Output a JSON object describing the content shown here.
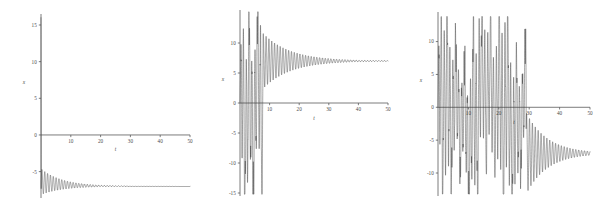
{
  "figure": {
    "background_color": "#ffffff",
    "line_color": "#3a3a3a",
    "axis_color": "#5a5a5a",
    "panel_count": 3
  },
  "chart_data": [
    {
      "type": "line",
      "title": "",
      "xlabel": "t",
      "ylabel": "x",
      "xlim": [
        0,
        50
      ],
      "ylim": [
        -8.6,
        16.5
      ],
      "grid": false,
      "legend": null,
      "xticks": [
        0,
        10,
        20,
        30,
        40,
        50
      ],
      "xticklabels": [
        "0",
        "10",
        "20",
        "30",
        "40",
        "50"
      ],
      "yticks": [
        -5,
        0,
        5,
        10,
        15
      ],
      "yticklabels": [
        "-5",
        "0",
        "5",
        "10",
        "15"
      ],
      "series": [
        {
          "name": "x(t)",
          "description": "Damped oscillation starting near x=16 at t=0, dropping immediately below zero and oscillating with decaying amplitude about an asymptote near x=-7.",
          "equilibrium": -7.0,
          "initial_value": 16.0,
          "damping": 0.14,
          "angular_frequency": 6.6,
          "initial_amplitude": 2.9,
          "phase": 0.0,
          "transient_start_t": 0.0,
          "transient_peak_t": 0.3
        }
      ]
    },
    {
      "type": "line",
      "title": "",
      "xlabel": "t",
      "ylabel": "x",
      "xlim": [
        0,
        50
      ],
      "ylim": [
        -15.5,
        15.5
      ],
      "grid": false,
      "legend": null,
      "xticks": [
        0,
        10,
        20,
        30,
        40,
        50
      ],
      "xticklabels": [
        "0",
        "10",
        "20",
        "30",
        "40",
        "50"
      ],
      "yticks": [
        -15,
        -10,
        -5,
        0,
        5,
        10
      ],
      "yticklabels": [
        "-15",
        "-10",
        "-5",
        "0",
        "5",
        "10"
      ],
      "series": [
        {
          "name": "x(t)",
          "description": "Chaotic burst of large spikes between t=0 and t=8 spanning -15 to +15, then settling into a damped oscillation decaying toward an asymptote near x=7.",
          "equilibrium": 7.0,
          "chaos_end_t": 7.8,
          "chaos_min": -15.2,
          "chaos_max": 15.2,
          "settle_amplitude": 4.6,
          "damping": 0.11,
          "angular_frequency": 6.6,
          "spike_times": [
            0.4,
            1.6,
            2.7,
            3.5,
            4.4,
            5.3,
            6.2,
            7.1
          ]
        }
      ]
    },
    {
      "type": "line",
      "title": "",
      "xlabel": "t",
      "ylabel": "x",
      "xlim": [
        0,
        50
      ],
      "ylim": [
        -13.5,
        14.5
      ],
      "grid": false,
      "legend": null,
      "xticks": [
        0,
        10,
        20,
        30,
        40,
        50
      ],
      "xticklabels": [
        "0",
        "10",
        "20",
        "30",
        "40",
        "50"
      ],
      "yticks": [
        -10,
        -5,
        0,
        5,
        10
      ],
      "yticklabels": [
        "-10",
        "-5",
        "0",
        "5",
        "10"
      ],
      "series": [
        {
          "name": "x(t)",
          "description": "Extended chaotic transient with repeated high-amplitude spike bands from t=0 to t=29, then a damped oscillation decaying toward an asymptote near x=-7.",
          "equilibrium": -7.0,
          "chaos_end_t": 29.0,
          "chaos_min": -13.2,
          "chaos_max": 13.8,
          "settle_amplitude": 6.2,
          "damping": 0.1,
          "angular_frequency": 6.6,
          "spike_bands": [
            [
              0,
              6.5
            ],
            [
              7.2,
              9.2
            ],
            [
              10.5,
              17.5
            ],
            [
              18.5,
              21.5
            ],
            [
              22.5,
              26.5
            ],
            [
              27.0,
              29.0
            ]
          ]
        }
      ]
    }
  ]
}
